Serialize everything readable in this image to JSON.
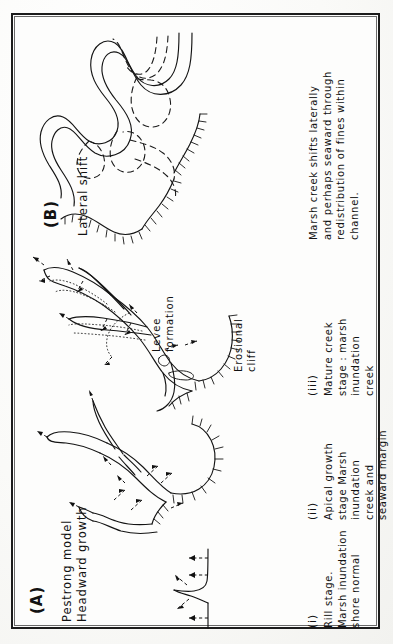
{
  "figure": {
    "background_color": "#fbfbfa",
    "ink_color": "#141414",
    "frame": true
  },
  "panels": [
    {
      "id": "B",
      "letter": "(B)",
      "heading": "Lateral shift",
      "caption_roman": "",
      "caption": "Marsh creek shifts laterally\nand perhaps seaward through\nredistribution of fines within\nchannel."
    },
    {
      "id": "A",
      "letter": "(A)",
      "heading": "Pestrong model\nHeadward growth",
      "stages": [
        {
          "roman": "(i)",
          "text": "Rill stage.\nMarsh inundation\nshore normal"
        },
        {
          "roman": "(ii)",
          "text": "Apical growth\nstage Marsh\ninundation\ncreek and\nseaward margin"
        },
        {
          "roman": "(iii)",
          "text": "Mature creek\nstage : marsh\ninundation\ncreek"
        }
      ]
    }
  ],
  "annotations": [
    {
      "name": "levee-formation",
      "text": "Levee\nformation"
    },
    {
      "name": "erosional-cliff",
      "text": "Erosional\ncliff"
    }
  ],
  "legend_keys": {
    "solid_line": "present creek margin",
    "dashed_line": "former creek position",
    "dotted_line": "levee deposit",
    "hachured_line": "erosional cliff / seaward margin",
    "dashed_arrow": "flow / growth direction"
  }
}
